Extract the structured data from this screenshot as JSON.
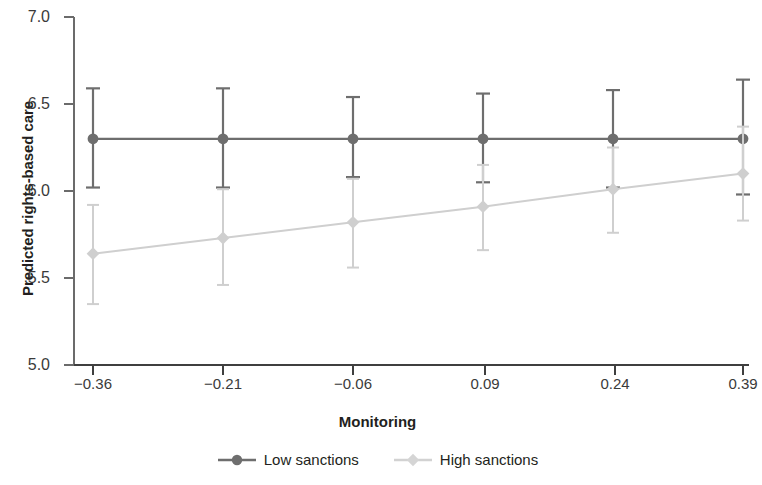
{
  "chart_data": {
    "type": "line",
    "title": "",
    "subtitle": "",
    "xlabel": "Monitoring",
    "ylabel": "Predicted rights-based care",
    "x": [
      -0.36,
      -0.21,
      -0.06,
      0.09,
      0.24,
      0.39
    ],
    "categories": [
      "-0.36",
      "-0.21",
      "-0.06",
      "0.09",
      "0.24",
      "0.39"
    ],
    "xtick_labels": [
      "−0.36",
      "−0.21",
      "−0.06",
      "0.09",
      "0.24",
      "0.39"
    ],
    "ytick_labels": [
      "7.0",
      "6.5",
      "6.0",
      "5.5",
      "5.0"
    ],
    "yticks": [
      7.0,
      6.5,
      6.0,
      5.5,
      5.0
    ],
    "xlim": [
      -0.36,
      0.39
    ],
    "ylim": [
      5.0,
      7.0
    ],
    "grid": false,
    "legend_position": "below",
    "error_bars": "95% confidence interval",
    "series": [
      {
        "name": "Low sanctions",
        "color": "#6e6e6e",
        "marker": "circle",
        "values": [
          6.3,
          6.3,
          6.3,
          6.3,
          6.3,
          6.3
        ],
        "ci_lower": [
          6.02,
          6.02,
          6.08,
          6.05,
          6.02,
          5.98
        ],
        "ci_upper": [
          6.59,
          6.59,
          6.54,
          6.56,
          6.58,
          6.64
        ]
      },
      {
        "name": "High sanctions",
        "color": "#cfcfcf",
        "marker": "diamond",
        "values": [
          5.64,
          5.73,
          5.82,
          5.91,
          6.01,
          6.1
        ],
        "ci_lower": [
          5.35,
          5.46,
          5.56,
          5.66,
          5.76,
          5.83
        ],
        "ci_upper": [
          5.92,
          6.01,
          6.07,
          6.15,
          6.25,
          6.37
        ]
      }
    ]
  },
  "legend": {
    "items": [
      {
        "label": "Low sanctions"
      },
      {
        "label": "High sanctions"
      }
    ]
  }
}
